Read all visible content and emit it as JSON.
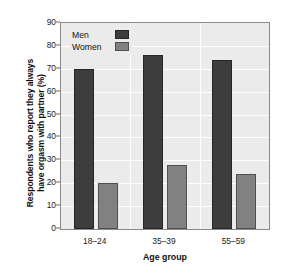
{
  "chart_data": {
    "type": "bar",
    "title": "",
    "subtitle": "",
    "xlabel": "Age group",
    "ylabel_line1": "Respondents who report they always",
    "ylabel_line2": "have orgasm with partner (%)",
    "categories": [
      "18–24",
      "35–39",
      "55–59"
    ],
    "series": [
      {
        "name": "Men",
        "values": [
          70,
          76,
          74
        ],
        "color": "#3d3d3d"
      },
      {
        "name": "Women",
        "values": [
          20,
          28,
          24
        ],
        "color": "#818181"
      }
    ],
    "ylim": [
      0,
      90
    ],
    "yticks": [
      0,
      10,
      20,
      30,
      40,
      50,
      60,
      70,
      80,
      90
    ],
    "ytick_labels": [
      "0",
      "10",
      "20",
      "30",
      "40",
      "50",
      "60",
      "70",
      "80",
      "90"
    ],
    "grid": true,
    "grid_axis": "y",
    "legend_position": "top-left",
    "plot_background": "#ebebeb",
    "gridline_color": "#ffffff",
    "axis_color": "#8a8a8a"
  },
  "legend": {
    "entries": [
      {
        "label": "Men"
      },
      {
        "label": "Women"
      }
    ]
  }
}
